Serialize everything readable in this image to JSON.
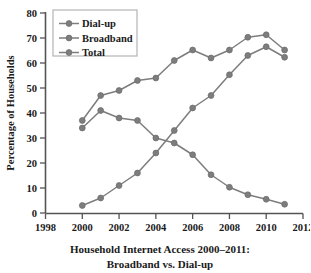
{
  "chart_data": {
    "type": "line",
    "title": "Household Internet Access 2000–2011:",
    "title_line2": "Broadband vs. Dial-up",
    "xlabel": "",
    "ylabel": "Percentage of Households",
    "xlim": [
      1998,
      2012
    ],
    "ylim": [
      0,
      80
    ],
    "x_ticks": [
      1998,
      2000,
      2002,
      2004,
      2006,
      2008,
      2010,
      2012
    ],
    "y_ticks": [
      0,
      10,
      20,
      30,
      40,
      50,
      60,
      70,
      80
    ],
    "grid": false,
    "legend_position": "upper-left",
    "x": [
      2000,
      2001,
      2002,
      2003,
      2004,
      2005,
      2006,
      2007,
      2008,
      2009,
      2010,
      2011
    ],
    "series": [
      {
        "name": "Dial-up",
        "color": "#7d7d7d",
        "values": [
          34,
          41,
          38,
          37,
          30,
          28,
          23.3,
          15.3,
          10.3,
          7.3,
          5.5,
          3.5
        ]
      },
      {
        "name": "Broadband",
        "color": "#7d7d7d",
        "values": [
          3,
          6,
          11,
          16,
          24,
          33,
          42,
          47,
          55.3,
          63,
          66.5,
          62.3
        ]
      },
      {
        "name": "Total",
        "color": "#7d7d7d",
        "values": [
          37,
          47,
          49,
          53,
          54,
          61,
          65.2,
          62,
          65.2,
          70.3,
          71.3,
          65.2
        ]
      }
    ]
  },
  "legend": {
    "items": [
      {
        "label": "Dial-up"
      },
      {
        "label": "Broadband"
      },
      {
        "label": "Total"
      }
    ]
  },
  "colors": {
    "series": "#7d7d7d",
    "axis": "#545454",
    "text": "#1a1a1a",
    "legend_border": "#b4b4b4",
    "background": "#ffffff"
  }
}
